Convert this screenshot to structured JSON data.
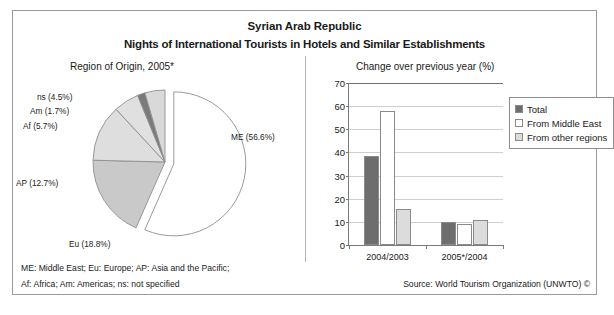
{
  "header": {
    "title_line1": "Syrian Arab Republic",
    "title_line2": "Nights of International Tourists in Hotels and Similar Establishments"
  },
  "footer": {
    "note_line1": "ME: Middle East; Eu: Europe; AP: Asia and the Pacific;",
    "note_line2": "Af: Africa; Am: Americas; ns: not specified",
    "source": "Source: World Tourism Organization (UNWTO) ©"
  },
  "colors": {
    "total": "#6e6e6e",
    "middle_east": "#ffffff",
    "other_regions": "#dcdcdc",
    "pie_me": "#ffffff",
    "pie_eu": "#c9c9c9",
    "pie_ap": "#dedede",
    "pie_af": "#e0e0e0",
    "pie_am": "#7a7a7a",
    "pie_ns": "#d9d9d9",
    "frame": "#9a9a9a",
    "grid": "#cfcfcf",
    "axis": "#7a7a7a"
  },
  "chart_data": [
    {
      "type": "pie",
      "title": "Region of Origin, 2005*",
      "xlabel": "",
      "ylabel": "",
      "legend_position": "labels-outside",
      "grid": false,
      "exploded_slice": "ME",
      "categories": [
        "ME",
        "Eu",
        "AP",
        "Af",
        "Am",
        "ns"
      ],
      "values": [
        56.6,
        18.8,
        12.7,
        5.7,
        1.7,
        4.5
      ],
      "labels": [
        "ME (56.6%)",
        "Eu (18.8%)",
        "AP (12.7%)",
        "Af (5.7%)",
        "Am (1.7%)",
        "ns (4.5%)"
      ]
    },
    {
      "type": "bar",
      "title": "Change over previous year (%)",
      "xlabel": "",
      "ylabel": "",
      "ylim": [
        0,
        70
      ],
      "yticks": [
        70,
        60,
        50,
        40,
        30,
        20,
        10,
        0
      ],
      "grid": true,
      "legend_position": "right",
      "categories": [
        "2004/2003",
        "2005*/2004"
      ],
      "series": [
        {
          "name": "Total",
          "values": [
            38.5,
            9.8
          ]
        },
        {
          "name": "From Middle East",
          "values": [
            58.0,
            9.0
          ]
        },
        {
          "name": "From other regions",
          "values": [
            15.7,
            10.8
          ]
        }
      ]
    }
  ]
}
